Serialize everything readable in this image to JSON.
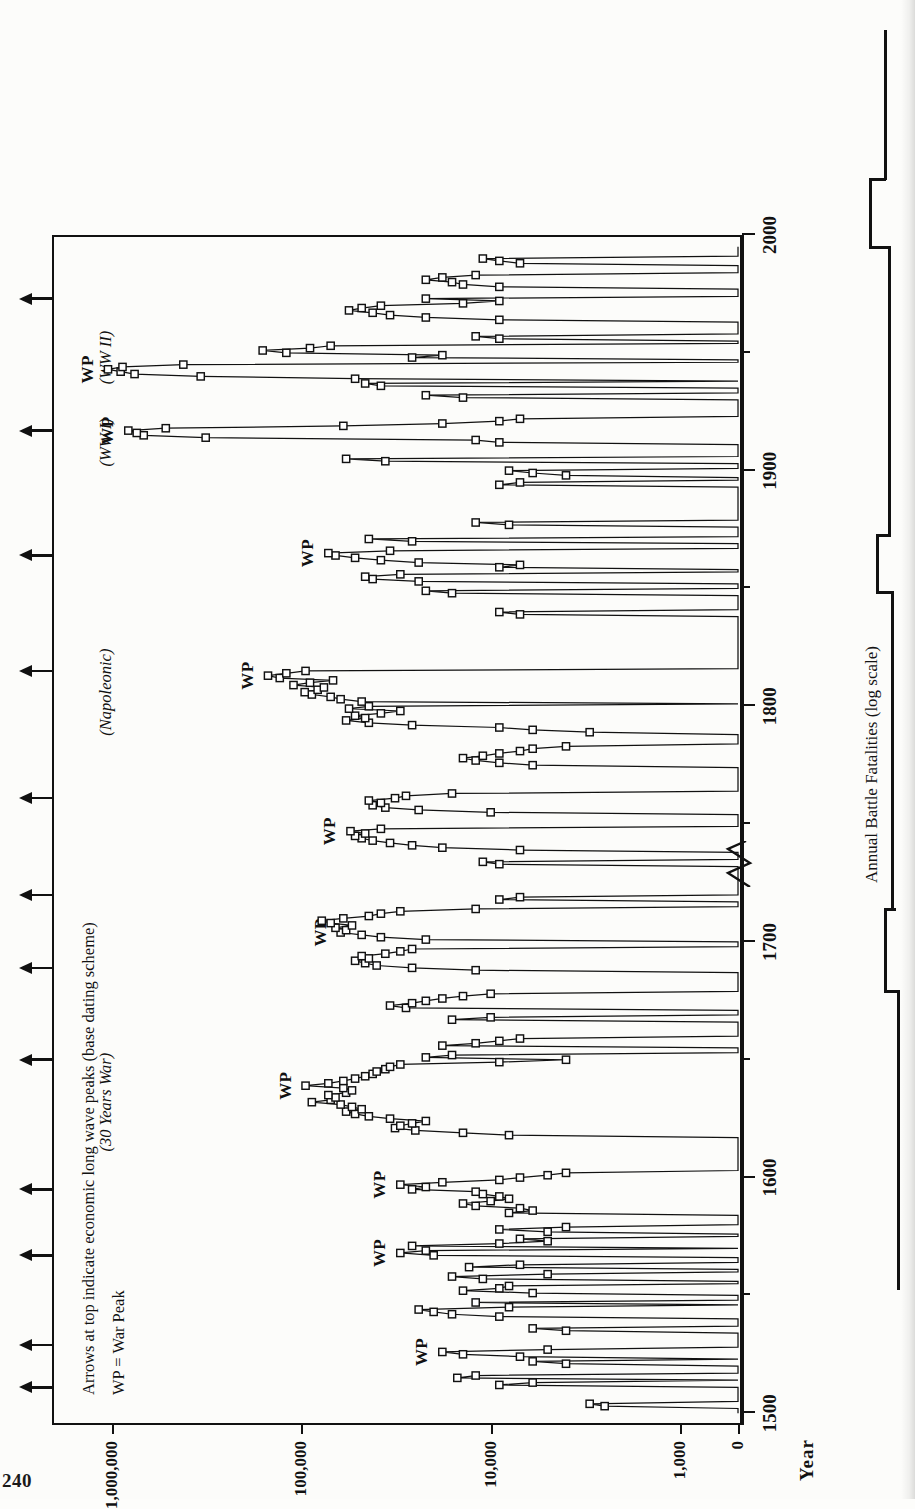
{
  "page": {
    "folio": "240"
  },
  "figure": {
    "value_axis_title": "Annual Battle Fatalities (log scale)",
    "time_axis_title": "Year",
    "legend": {
      "line1": "Arrows at top indicate economic long wave peaks (base dating scheme)",
      "line2": "WP = War Peak"
    },
    "war_peak_label": "WP",
    "eras": [
      {
        "label": "(30 Years War)",
        "year": 1632
      },
      {
        "label": "(Napoleonic)",
        "year": 1806
      },
      {
        "label": "(WW I)",
        "year": 1912
      },
      {
        "label": "(WW II)",
        "year": 1948
      }
    ],
    "war_peaks": [
      {
        "label": "WP",
        "year": 1526
      },
      {
        "label": "WP",
        "year": 1568
      },
      {
        "label": "WP",
        "year": 1597
      },
      {
        "label": "WP",
        "year": 1639
      },
      {
        "label": "WP",
        "year": 1704
      },
      {
        "label": "WP",
        "year": 1747
      },
      {
        "label": "WP",
        "year": 1813
      },
      {
        "label": "WP",
        "year": 1865
      },
      {
        "label": "WP",
        "year": 1917
      },
      {
        "label": "WP",
        "year": 1943
      }
    ],
    "long_wave_arrows": [
      1511,
      1529,
      1567,
      1595,
      1650,
      1689,
      1720,
      1761,
      1815,
      1864,
      1917,
      1973
    ]
  },
  "chart_data": {
    "type": "line",
    "title": "Annual Battle Fatalities (log scale)",
    "xlabel": "Year",
    "ylabel": "Annual Battle Fatalities (log scale)",
    "xlim": [
      1495,
      2000
    ],
    "ylim": [
      0,
      1000000
    ],
    "yscale": "log",
    "y_axis_break": true,
    "y_ticks": [
      0,
      1000,
      10000,
      100000,
      1000000
    ],
    "y_tick_labels": [
      "0",
      "1,000",
      "10,000",
      "100,000",
      "1,000,000"
    ],
    "x_ticks_major": [
      1500,
      1600,
      1700,
      1800,
      1900,
      2000
    ],
    "x_tick_labels": [
      "1500",
      "1600",
      "1700",
      "1800",
      "1900",
      "2000"
    ],
    "x_ticks_minor": [
      1550,
      1650,
      1750,
      1850,
      1950
    ],
    "grid": false,
    "legend_position": "upper-left-inside",
    "marker": "open-square",
    "series": [
      {
        "name": "Annual battle fatalities",
        "x": [
          1500,
          1501,
          1502,
          1503,
          1504,
          1505,
          1506,
          1507,
          1508,
          1509,
          1510,
          1511,
          1512,
          1513,
          1514,
          1515,
          1516,
          1517,
          1518,
          1519,
          1520,
          1521,
          1522,
          1523,
          1524,
          1525,
          1526,
          1527,
          1528,
          1529,
          1530,
          1531,
          1532,
          1533,
          1534,
          1535,
          1536,
          1537,
          1538,
          1539,
          1540,
          1541,
          1542,
          1543,
          1544,
          1545,
          1546,
          1547,
          1548,
          1549,
          1550,
          1551,
          1552,
          1553,
          1554,
          1555,
          1556,
          1557,
          1558,
          1559,
          1560,
          1561,
          1562,
          1563,
          1564,
          1565,
          1566,
          1567,
          1568,
          1569,
          1570,
          1571,
          1572,
          1573,
          1574,
          1575,
          1576,
          1577,
          1578,
          1579,
          1580,
          1581,
          1582,
          1583,
          1584,
          1585,
          1586,
          1587,
          1588,
          1589,
          1590,
          1591,
          1592,
          1593,
          1594,
          1595,
          1596,
          1597,
          1598,
          1599,
          1600,
          1601,
          1602,
          1603,
          1604,
          1605,
          1606,
          1607,
          1608,
          1609,
          1610,
          1611,
          1612,
          1613,
          1614,
          1615,
          1616,
          1617,
          1618,
          1619,
          1620,
          1621,
          1622,
          1623,
          1624,
          1625,
          1626,
          1627,
          1628,
          1629,
          1630,
          1631,
          1632,
          1633,
          1634,
          1635,
          1636,
          1637,
          1638,
          1639,
          1640,
          1641,
          1642,
          1643,
          1644,
          1645,
          1646,
          1647,
          1648,
          1649,
          1650,
          1651,
          1652,
          1653,
          1654,
          1655,
          1656,
          1657,
          1658,
          1659,
          1660,
          1661,
          1662,
          1663,
          1664,
          1665,
          1666,
          1667,
          1668,
          1669,
          1670,
          1671,
          1672,
          1673,
          1674,
          1675,
          1676,
          1677,
          1678,
          1679,
          1680,
          1681,
          1682,
          1683,
          1684,
          1685,
          1686,
          1687,
          1688,
          1689,
          1690,
          1691,
          1692,
          1693,
          1694,
          1695,
          1696,
          1697,
          1698,
          1699,
          1700,
          1701,
          1702,
          1703,
          1704,
          1705,
          1706,
          1707,
          1708,
          1709,
          1710,
          1711,
          1712,
          1713,
          1714,
          1715,
          1716,
          1717,
          1718,
          1719,
          1720,
          1721,
          1722,
          1723,
          1724,
          1725,
          1726,
          1727,
          1728,
          1729,
          1730,
          1731,
          1732,
          1733,
          1734,
          1735,
          1736,
          1737,
          1738,
          1739,
          1740,
          1741,
          1742,
          1743,
          1744,
          1745,
          1746,
          1747,
          1748,
          1749,
          1750,
          1751,
          1752,
          1753,
          1754,
          1755,
          1756,
          1757,
          1758,
          1759,
          1760,
          1761,
          1762,
          1763,
          1764,
          1765,
          1766,
          1767,
          1768,
          1769,
          1770,
          1771,
          1772,
          1773,
          1774,
          1775,
          1776,
          1777,
          1778,
          1779,
          1780,
          1781,
          1782,
          1783,
          1784,
          1785,
          1786,
          1787,
          1788,
          1789,
          1790,
          1791,
          1792,
          1793,
          1794,
          1795,
          1796,
          1797,
          1798,
          1799,
          1800,
          1801,
          1802,
          1803,
          1804,
          1805,
          1806,
          1807,
          1808,
          1809,
          1810,
          1811,
          1812,
          1813,
          1814,
          1815,
          1816,
          1817,
          1818,
          1819,
          1820,
          1821,
          1822,
          1823,
          1824,
          1825,
          1826,
          1827,
          1828,
          1829,
          1830,
          1831,
          1832,
          1833,
          1834,
          1835,
          1836,
          1837,
          1838,
          1839,
          1840,
          1841,
          1842,
          1843,
          1844,
          1845,
          1846,
          1847,
          1848,
          1849,
          1850,
          1851,
          1852,
          1853,
          1854,
          1855,
          1856,
          1857,
          1858,
          1859,
          1860,
          1861,
          1862,
          1863,
          1864,
          1865,
          1866,
          1867,
          1868,
          1869,
          1870,
          1871,
          1872,
          1873,
          1874,
          1875,
          1876,
          1877,
          1878,
          1879,
          1880,
          1881,
          1882,
          1883,
          1884,
          1885,
          1886,
          1887,
          1888,
          1889,
          1890,
          1891,
          1892,
          1893,
          1894,
          1895,
          1896,
          1897,
          1898,
          1899,
          1900,
          1901,
          1902,
          1903,
          1904,
          1905,
          1906,
          1907,
          1908,
          1909,
          1910,
          1911,
          1912,
          1913,
          1914,
          1915,
          1916,
          1917,
          1918,
          1919,
          1920,
          1921,
          1922,
          1923,
          1924,
          1925,
          1926,
          1927,
          1928,
          1929,
          1930,
          1931,
          1932,
          1933,
          1934,
          1935,
          1936,
          1937,
          1938,
          1939,
          1940,
          1941,
          1942,
          1943,
          1944,
          1945,
          1946,
          1947,
          1948,
          1949,
          1950,
          1951,
          1952,
          1953,
          1954,
          1955,
          1956,
          1957,
          1958,
          1959,
          1960,
          1961,
          1962,
          1963,
          1964,
          1965,
          1966,
          1967,
          1968,
          1969,
          1970,
          1971,
          1972,
          1973,
          1974,
          1975,
          1976,
          1977,
          1978,
          1979,
          1980,
          1981,
          1982,
          1983,
          1984,
          1985,
          1986,
          1987,
          1988,
          1989,
          1990,
          1991,
          1992,
          1993,
          1994,
          1995
        ],
        "y": [
          0,
          0,
          0,
          2500,
          3000,
          0,
          0,
          0,
          0,
          0,
          0,
          0,
          9000,
          6000,
          0,
          15000,
          12000,
          0,
          0,
          0,
          0,
          4000,
          6000,
          0,
          7000,
          14000,
          18000,
          5000,
          0,
          0,
          0,
          0,
          0,
          0,
          0,
          4000,
          6000,
          0,
          0,
          0,
          0,
          9000,
          16000,
          20000,
          24000,
          8000,
          0,
          12000,
          0,
          0,
          0,
          6000,
          14000,
          9000,
          8000,
          0,
          0,
          11000,
          16000,
          5000,
          0,
          0,
          13000,
          7000,
          0,
          0,
          0,
          20000,
          30000,
          22000,
          0,
          26000,
          9000,
          5000,
          7000,
          0,
          0,
          5000,
          9000,
          4000,
          0,
          0,
          0,
          0,
          0,
          8000,
          6000,
          7000,
          12000,
          14000,
          10000,
          8000,
          9000,
          11000,
          12000,
          26000,
          22000,
          30000,
          18000,
          9000,
          7000,
          5000,
          4000,
          0,
          0,
          0,
          0,
          0,
          0,
          0,
          0,
          0,
          0,
          0,
          0,
          0,
          0,
          0,
          8000,
          14000,
          25000,
          32000,
          30000,
          26000,
          22000,
          34000,
          44000,
          52000,
          58000,
          48000,
          54000,
          62000,
          88000,
          70000,
          66000,
          72000,
          58000,
          54000,
          60000,
          95000,
          72000,
          60000,
          52000,
          46000,
          42000,
          40000,
          36000,
          34000,
          30000,
          9000,
          4000,
          22000,
          16000,
          0,
          0,
          0,
          18000,
          12000,
          9000,
          7000,
          0,
          0,
          0,
          0,
          0,
          0,
          0,
          16000,
          10000,
          0,
          0,
          0,
          28000,
          34000,
          26000,
          22000,
          18000,
          14000,
          10000,
          0,
          0,
          0,
          0,
          0,
          0,
          0,
          0,
          0,
          12000,
          26000,
          40000,
          46000,
          52000,
          44000,
          48000,
          36000,
          30000,
          26000,
          0,
          0,
          0,
          22000,
          38000,
          48000,
          62000,
          58000,
          66000,
          54000,
          70000,
          78000,
          60000,
          44000,
          38000,
          30000,
          12000,
          0,
          0,
          0,
          9000,
          7000,
          0,
          0,
          0,
          0,
          0,
          0,
          0,
          0,
          0,
          0,
          0,
          0,
          0,
          9000,
          11000,
          0,
          0,
          0,
          0,
          7000,
          18000,
          26000,
          34000,
          42000,
          48000,
          52000,
          46000,
          55000,
          38000,
          0,
          0,
          0,
          0,
          0,
          0,
          10000,
          24000,
          36000,
          42000,
          38000,
          44000,
          32000,
          28000,
          16000,
          0,
          0,
          0,
          0,
          0,
          0,
          0,
          0,
          0,
          0,
          0,
          6000,
          9000,
          12000,
          14000,
          11000,
          9000,
          7000,
          6000,
          4000,
          0,
          0,
          0,
          0,
          0,
          3000,
          6000,
          9000,
          26000,
          44000,
          58000,
          46000,
          52000,
          38000,
          30000,
          56000,
          44000,
          0,
          48000,
          62000,
          70000,
          88000,
          96000,
          82000,
          76000,
          110000,
          90000,
          68000,
          130000,
          150000,
          120000,
          95000,
          0,
          0,
          0,
          0,
          0,
          0,
          0,
          0,
          0,
          0,
          0,
          0,
          0,
          0,
          0,
          0,
          0,
          0,
          0,
          0,
          0,
          0,
          0,
          7000,
          9000,
          0,
          0,
          0,
          0,
          0,
          0,
          0,
          16000,
          22000,
          0,
          0,
          0,
          24000,
          42000,
          46000,
          30000,
          0,
          0,
          9000,
          7000,
          24000,
          38000,
          52000,
          66000,
          72000,
          34000,
          0,
          0,
          0,
          26000,
          44000,
          0,
          0,
          0,
          0,
          0,
          8000,
          12000,
          0,
          0,
          0,
          0,
          0,
          0,
          0,
          0,
          0,
          0,
          0,
          0,
          0,
          0,
          0,
          9000,
          7000,
          0,
          0,
          4000,
          6000,
          8000,
          0,
          0,
          0,
          36000,
          58000,
          0,
          0,
          0,
          0,
          0,
          0,
          9000,
          12000,
          320000,
          680000,
          740000,
          820000,
          520000,
          60000,
          18000,
          9000,
          7000,
          0,
          0,
          0,
          0,
          0,
          0,
          0,
          0,
          14000,
          22000,
          0,
          0,
          0,
          38000,
          46000,
          0,
          52000,
          340000,
          760000,
          900000,
          1050000,
          880000,
          420000,
          0,
          0,
          26000,
          18000,
          120000,
          160000,
          90000,
          70000,
          0,
          0,
          9000,
          12000,
          0,
          0,
          0,
          0,
          0,
          0,
          9000,
          22000,
          34000,
          42000,
          56000,
          48000,
          38000,
          14000,
          9000,
          22000,
          0,
          0,
          0,
          0,
          9000,
          14000,
          16000,
          22000,
          18000,
          12000,
          0,
          0,
          0,
          0,
          7000,
          9000,
          11000,
          0,
          0,
          0,
          0,
          0
        ]
      }
    ]
  }
}
